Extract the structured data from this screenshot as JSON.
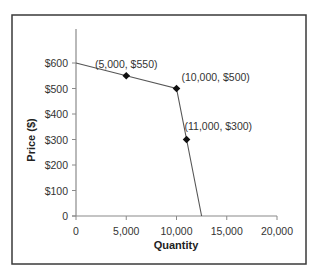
{
  "chart_data": {
    "type": "line",
    "title": "",
    "xlabel": "Quantity",
    "ylabel": "Price ($)",
    "xlim": [
      0,
      20000
    ],
    "ylim": [
      0,
      650
    ],
    "x_ticks": [
      0,
      5000,
      10000,
      15000,
      20000
    ],
    "x_tick_labels": [
      "0",
      "5,000",
      "10,000",
      "15,000",
      "20,000"
    ],
    "y_ticks": [
      0,
      100,
      200,
      300,
      400,
      500,
      600
    ],
    "y_tick_labels": [
      "0",
      "$100",
      "$200",
      "$300",
      "$400",
      "$500",
      "$600"
    ],
    "grid": false,
    "legend": null,
    "series": [
      {
        "name": "Demand curve",
        "x": [
          0,
          5000,
          10000,
          11000,
          12500
        ],
        "y": [
          600,
          550,
          500,
          300,
          0
        ]
      }
    ],
    "markers": [
      {
        "x": 5000,
        "y": 550,
        "label": "(5,000, $550)"
      },
      {
        "x": 10000,
        "y": 500,
        "label": "(10,000, $500)"
      },
      {
        "x": 11000,
        "y": 300,
        "label": "(11,000, $300)"
      }
    ]
  }
}
